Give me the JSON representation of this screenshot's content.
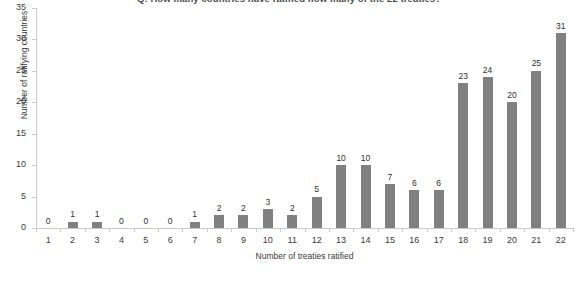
{
  "chart_data": {
    "type": "bar",
    "title": "Q: How many countries have ratified how many of the 22 treaties?",
    "xlabel": "Number of treaties ratified",
    "ylabel": "Number of ratifying countries",
    "categories": [
      "1",
      "2",
      "3",
      "4",
      "5",
      "6",
      "7",
      "8",
      "9",
      "10",
      "11",
      "12",
      "13",
      "14",
      "15",
      "16",
      "17",
      "18",
      "19",
      "20",
      "21",
      "22"
    ],
    "values": [
      0,
      1,
      1,
      0,
      0,
      0,
      1,
      2,
      2,
      3,
      2,
      5,
      10,
      10,
      7,
      6,
      6,
      23,
      24,
      20,
      25,
      31
    ],
    "data_labels": [
      "0",
      "1",
      "1",
      "0",
      "0",
      "0",
      "1",
      "2",
      "2",
      "3",
      "2",
      "5",
      "10",
      "10",
      "7",
      "6",
      "6",
      "23",
      "24",
      "20",
      "25",
      "31"
    ],
    "ylim": [
      0,
      35
    ],
    "ytick_step": 5,
    "yticks": [
      "0",
      "5",
      "10",
      "15",
      "20",
      "25",
      "30",
      "35"
    ],
    "grid": false,
    "legend": false,
    "bar_color": "#808080",
    "axis_color": "#c9c9c9",
    "background_color": "#ffffff",
    "text_color": "#3a3a3a"
  }
}
